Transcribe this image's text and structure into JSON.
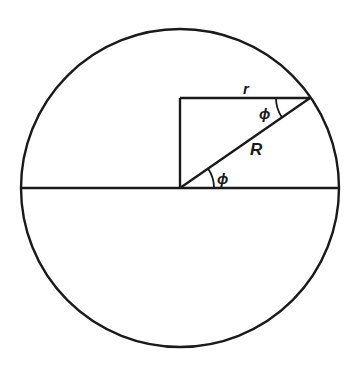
{
  "diagram": {
    "type": "geometry",
    "colors": {
      "stroke": "#1a1a1a",
      "background": "#ffffff"
    },
    "labels": {
      "r": "r",
      "R": "R",
      "phi_top": "ϕ",
      "phi_bottom": "ϕ"
    }
  }
}
